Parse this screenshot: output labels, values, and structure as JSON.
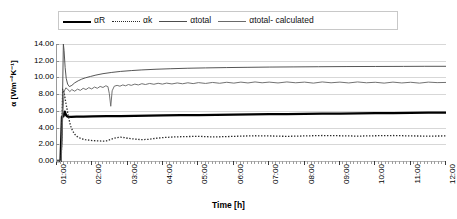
{
  "legend": {
    "items": [
      {
        "label": "αR",
        "style": "thick-solid"
      },
      {
        "label": "αk",
        "style": "dotted"
      },
      {
        "label": "αtotal",
        "style": "thin-solid"
      },
      {
        "label": "αtotal- calculated",
        "style": "thin-solid-2"
      }
    ]
  },
  "chart_data": {
    "type": "line",
    "title": "",
    "xlabel": "Time [h]",
    "ylabel": "α [Wm⁻²K⁻¹]",
    "ylim": [
      0,
      14
    ],
    "yticks": [
      "0.00",
      "2.00",
      "4.00",
      "6.00",
      "8.00",
      "10.00",
      "12.00",
      "14.00"
    ],
    "ytick_values": [
      0,
      2,
      4,
      6,
      8,
      10,
      12,
      14
    ],
    "xlim": [
      "01:00",
      "12:00"
    ],
    "categories": [
      "01:00",
      "02:00",
      "03:00",
      "04:00",
      "05:00",
      "06:00",
      "07:00",
      "08:00",
      "09:00",
      "10:00",
      "11:00",
      "12:00"
    ],
    "grid": "horizontal",
    "legend_position": "top",
    "series": [
      {
        "name": "αR",
        "style": "thick-solid",
        "color": "#000000",
        "x": [
          1.0,
          1.1,
          1.14,
          1.18,
          1.22,
          1.26,
          1.3,
          1.4,
          1.55,
          1.75,
          2.0,
          2.4,
          2.8,
          3.2,
          3.6,
          4.0,
          4.5,
          5.0,
          5.5,
          6.0,
          6.5,
          7.0,
          7.5,
          8.0,
          8.5,
          9.0,
          9.5,
          10.0,
          10.5,
          11.0,
          11.5,
          12.0
        ],
        "values": [
          0.0,
          0.0,
          5.3,
          5.35,
          5.9,
          5.45,
          5.3,
          5.28,
          5.3,
          5.32,
          5.34,
          5.36,
          5.38,
          5.4,
          5.42,
          5.45,
          5.48,
          5.5,
          5.53,
          5.55,
          5.58,
          5.6,
          5.62,
          5.64,
          5.66,
          5.68,
          5.7,
          5.72,
          5.74,
          5.76,
          5.78,
          5.8
        ]
      },
      {
        "name": "αk",
        "style": "dotted",
        "color": "#2b2b2b",
        "x": [
          1.0,
          1.12,
          1.16,
          1.2,
          1.24,
          1.28,
          1.32,
          1.36,
          1.4,
          1.45,
          1.5,
          1.56,
          1.62,
          1.7,
          1.8,
          1.9,
          2.0,
          2.1,
          2.2,
          2.3,
          2.4,
          2.5,
          2.6,
          2.7,
          2.8,
          2.9,
          3.0,
          3.2,
          3.4,
          3.6,
          3.8,
          4.0,
          4.3,
          4.6,
          5.0,
          5.4,
          5.8,
          6.2,
          6.6,
          7.0,
          7.5,
          8.0,
          8.5,
          9.0,
          9.5,
          10.0,
          10.5,
          11.0,
          11.5,
          12.0
        ],
        "values": [
          0.0,
          0.0,
          8.6,
          8.2,
          7.2,
          6.3,
          5.4,
          4.6,
          4.0,
          3.55,
          3.2,
          2.95,
          2.8,
          2.65,
          2.55,
          2.5,
          2.45,
          2.42,
          2.4,
          2.38,
          2.4,
          2.55,
          2.7,
          2.8,
          2.85,
          2.8,
          2.72,
          2.62,
          2.55,
          2.6,
          2.72,
          2.8,
          2.88,
          2.92,
          2.95,
          2.88,
          2.92,
          2.98,
          3.02,
          3.0,
          2.95,
          3.0,
          3.05,
          3.02,
          2.98,
          3.02,
          3.05,
          3.0,
          2.98,
          3.0
        ]
      },
      {
        "name": "αtotal",
        "style": "thin-solid",
        "color": "#4d4d4d",
        "x": [
          1.0,
          1.12,
          1.15,
          1.18,
          1.2,
          1.23,
          1.26,
          1.3,
          1.35,
          1.42,
          1.5,
          1.6,
          1.7,
          1.8,
          1.95,
          2.1,
          2.3,
          2.55,
          2.8,
          3.1,
          3.4,
          3.8,
          4.2,
          4.7,
          5.2,
          5.8,
          6.4,
          7.0,
          7.7,
          8.4,
          9.2,
          10.0,
          10.8,
          11.4,
          12.0
        ],
        "values": [
          0.0,
          0.0,
          6.0,
          14.0,
          13.2,
          11.2,
          9.9,
          9.2,
          8.9,
          9.05,
          9.35,
          9.6,
          9.8,
          9.95,
          10.12,
          10.28,
          10.45,
          10.6,
          10.72,
          10.82,
          10.9,
          10.98,
          11.04,
          11.1,
          11.14,
          11.18,
          11.21,
          11.24,
          11.26,
          11.28,
          11.3,
          11.31,
          11.32,
          11.33,
          11.33
        ]
      },
      {
        "name": "αtotal- calculated",
        "style": "thin-solid-2",
        "color": "#6a6a6a",
        "x": [
          1.0,
          1.12,
          1.16,
          1.2,
          1.25,
          1.3,
          1.36,
          1.42,
          1.5,
          1.58,
          1.66,
          1.74,
          1.82,
          1.9,
          1.98,
          2.06,
          2.14,
          2.22,
          2.3,
          2.38,
          2.44,
          2.48,
          2.52,
          2.56,
          2.62,
          2.7,
          2.78,
          2.86,
          2.94,
          3.02,
          3.1,
          3.2,
          3.3,
          3.4,
          3.5,
          3.62,
          3.74,
          3.86,
          3.98,
          4.1,
          4.25,
          4.4,
          4.55,
          4.7,
          4.85,
          5.0,
          5.2,
          5.4,
          5.6,
          5.8,
          6.0,
          6.2,
          6.4,
          6.6,
          6.8,
          7.0,
          7.25,
          7.5,
          7.75,
          8.0,
          8.25,
          8.5,
          8.75,
          9.0,
          9.25,
          9.5,
          9.75,
          10.0,
          10.25,
          10.5,
          10.75,
          11.0,
          11.25,
          11.5,
          11.75,
          12.0
        ],
        "values": [
          0.0,
          0.0,
          5.2,
          8.3,
          8.75,
          8.6,
          8.3,
          8.55,
          8.35,
          8.6,
          8.45,
          8.7,
          8.55,
          8.78,
          8.62,
          8.85,
          8.7,
          8.92,
          8.8,
          9.0,
          8.9,
          8.05,
          6.55,
          8.4,
          8.95,
          9.05,
          8.95,
          9.1,
          9.0,
          9.15,
          9.05,
          9.2,
          9.1,
          9.25,
          9.15,
          9.28,
          9.18,
          9.3,
          9.2,
          9.32,
          9.22,
          9.34,
          9.24,
          9.36,
          9.26,
          9.38,
          9.28,
          9.4,
          9.3,
          9.42,
          9.32,
          9.44,
          9.34,
          9.46,
          9.36,
          9.44,
          9.34,
          9.46,
          9.36,
          9.44,
          9.32,
          9.46,
          9.36,
          9.44,
          9.34,
          9.46,
          9.36,
          9.42,
          9.32,
          9.44,
          9.34,
          9.42,
          9.32,
          9.44,
          9.38,
          9.4
        ]
      }
    ]
  }
}
